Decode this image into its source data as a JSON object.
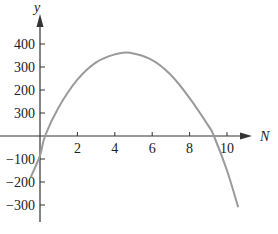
{
  "chart_data": {
    "type": "line",
    "title": "",
    "xlabel": "N",
    "ylabel": "y",
    "x_ticks": [
      2,
      4,
      6,
      8,
      10
    ],
    "y_ticks": [
      400,
      300,
      200,
      300,
      -100,
      -200,
      -300
    ],
    "y_tick_values": [
      400,
      300,
      200,
      100,
      -100,
      -200,
      -300
    ],
    "xlim": [
      0,
      11
    ],
    "ylim": [
      -380,
      460
    ],
    "grid": false,
    "legend": null,
    "series": [
      {
        "name": "curve",
        "color": "#9a9a9a",
        "x": [
          -0.5,
          0,
          0.27,
          1,
          2,
          3,
          4,
          4.8,
          6,
          7,
          8,
          9,
          9.3,
          10,
          10.6
        ],
        "y": [
          -180,
          -85,
          0,
          125,
          245,
          320,
          355,
          362,
          330,
          265,
          165,
          45,
          0,
          -150,
          -310
        ]
      }
    ]
  }
}
